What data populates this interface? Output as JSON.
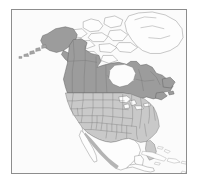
{
  "figure": {
    "kind": "reference-map",
    "projection_hint": "conic",
    "frame": {
      "visible": true,
      "border_color": "#8d8d8d"
    },
    "background_color": "#ffffff",
    "ocean_color": "#fbfbfb",
    "has_labels": false,
    "has_legend": false,
    "has_title": false,
    "has_scale_bar": false,
    "has_graticule": false
  },
  "palette": {
    "land_primary": "#9c9c9c",
    "land_subdivided": "#c9c9c9",
    "land_unfilled": "#fdfdfd",
    "relief_shading": "#b4b4b4",
    "boundary_line": "#5c5c5c",
    "subdivision_line": "#6e6e6e",
    "water": "#fcfcfc"
  },
  "regions": [
    {
      "name": "Alaska",
      "fill_class": "land-primary",
      "subdivided": false,
      "note": "northwest corner, includes Aleutian island chain trailing southwest"
    },
    {
      "name": "Canada",
      "fill_class": "land-primary",
      "subdivided": true,
      "note": "provinces and territories shown with internal boundary lines"
    },
    {
      "name": "Contiguous United States",
      "fill_class": "land-states",
      "subdivided": true,
      "note": "lighter fill with full state boundary grid"
    },
    {
      "name": "Greenland",
      "fill_class": "land-blank",
      "subdivided": false,
      "note": "outline only, no fill, upper right"
    },
    {
      "name": "Canadian Arctic Archipelago",
      "fill_class": "land-blank",
      "subdivided": false,
      "note": "cluster of unfilled islands across the top"
    },
    {
      "name": "Mexico",
      "fill_class": "land-blank",
      "subdivided": false,
      "note": "outline only with gray relief shading along the western cordillera"
    },
    {
      "name": "Central America",
      "fill_class": "land-blank",
      "subdivided": false,
      "note": "narrow isthmus at lower edge, outline only"
    },
    {
      "name": "Caribbean Islands",
      "fill_class": "land-blank",
      "subdivided": false,
      "note": "Cuba, Hispaniola, Puerto Rico and Lesser Antilles arc"
    }
  ],
  "water_features": [
    {
      "name": "Great Lakes",
      "note": "white lake shapes inside the United States"
    },
    {
      "name": "Hudson Bay",
      "note": "large white embayment in central Canada"
    },
    {
      "name": "Gulf of Mexico",
      "note": "open water south of the United States"
    },
    {
      "name": "Pacific Ocean",
      "note": "open water west"
    },
    {
      "name": "Atlantic Ocean",
      "note": "open water east"
    }
  ]
}
